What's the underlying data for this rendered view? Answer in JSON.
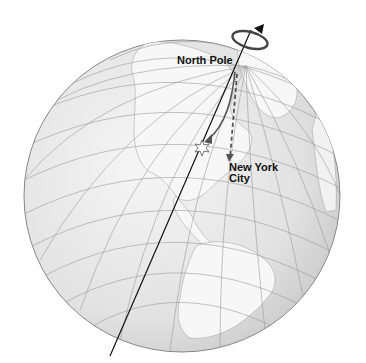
{
  "diagram": {
    "labels": {
      "north_pole": "North Pole",
      "new_york_line1": "New York",
      "new_york_line2": "City"
    },
    "elements": {
      "rotation_arrow": "counterclockwise rotation arrow around axis",
      "dashed_path": "straight-line path from North Pole toward New York City",
      "curved_path": "deflected path ending west of New York City"
    },
    "colors": {
      "ocean": "#e6e6e6",
      "land": "#f4f4f4",
      "grid": "#9a9a9a",
      "paths": "#555555",
      "axis": "#111111"
    }
  }
}
